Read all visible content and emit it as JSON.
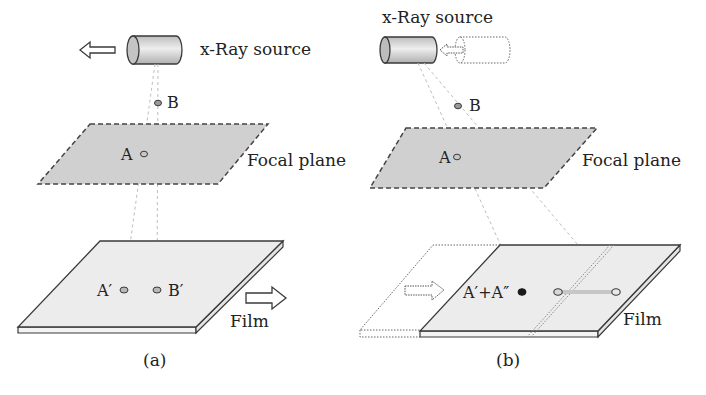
{
  "panel_a": {
    "caption": "(a)",
    "source_label": "x-Ray source",
    "point_b_label": "B",
    "point_a_label": "A",
    "focal_plane_label": "Focal plane",
    "film_label": "Film",
    "proj_a_label": "A′",
    "proj_b_label": "B′",
    "source_motion": "left",
    "film_motion": "right"
  },
  "panel_b": {
    "caption": "(b)",
    "source_label": "x-Ray source",
    "point_b_label": "B",
    "point_a_label": "A",
    "focal_plane_label": "Focal plane",
    "film_label": "Film",
    "combined_label": "A′+A″",
    "source_motion": "left",
    "film_motion": "right"
  },
  "colors": {
    "plane_fill": "#d0d0d0",
    "film_fill": "#ececec",
    "outline": "#3a3a3a",
    "ray": "#bdbdbd",
    "text": "#222222"
  }
}
